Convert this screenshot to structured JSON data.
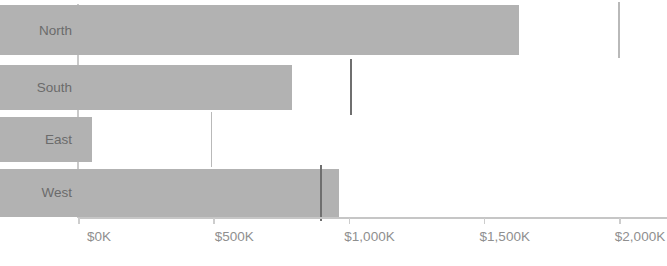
{
  "chart": {
    "type": "bar",
    "orientation": "horizontal",
    "title": "",
    "xlabel": "",
    "ylabel": "",
    "bar_color": "#b2b2b2",
    "reference_line_color": "#6f6f6f",
    "axis_color": "#c6c6c6",
    "label_color": "#6b6b6b",
    "tick_label_color": "#8f8f8f",
    "background": "#ffffff"
  },
  "chart_data": {
    "type": "bar",
    "orientation": "horizontal",
    "title": "",
    "xlabel": "",
    "ylabel": "",
    "categories": [
      "North",
      "South",
      "East",
      "West"
    ],
    "values": [
      1920,
      1078,
      340,
      1255
    ],
    "series": [
      {
        "name": "Sales",
        "values": [
          1920,
          1078,
          340,
          1255
        ]
      },
      {
        "name": "Target",
        "values": [
          2000,
          1010,
          495,
          900
        ]
      }
    ],
    "reference_values": [
      2000,
      1010,
      495,
      900
    ],
    "xlim": [
      0,
      2000
    ],
    "xticks": [
      0,
      500,
      1000,
      1500,
      2000
    ],
    "xtick_labels": [
      "$0K",
      "$500K",
      "$1,000K",
      "$1,500K",
      "$2,000K"
    ],
    "units": "thousands of dollars",
    "grid": false,
    "legend": false
  },
  "axis": {
    "x_tick_labels": [
      "$0K",
      "$500K",
      "$1,000K",
      "$1,500K",
      "$2,000K"
    ],
    "y_tick_labels": [
      "North",
      "South",
      "East",
      "West"
    ]
  },
  "bars": [
    {
      "category": "North",
      "value": 1920,
      "reference": 2000,
      "reference_style": "light"
    },
    {
      "category": "South",
      "value": 1078,
      "reference": 1010,
      "reference_style": "dark"
    },
    {
      "category": "East",
      "value": 340,
      "reference": 495,
      "reference_style": "light"
    },
    {
      "category": "West",
      "value": 1255,
      "reference": 900,
      "reference_style": "dark"
    }
  ]
}
